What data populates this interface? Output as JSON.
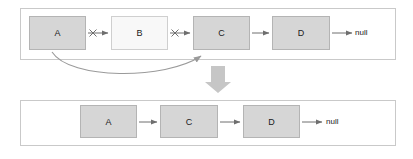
{
  "diagram": {
    "colors": {
      "node_fill": "#d6d6d6",
      "node_removed_fill": "#f8f8f8",
      "node_border": "#b4b4b4",
      "panel_border": "#c9c9c9",
      "arrow": "#6e6e6e",
      "curve_arrow": "#9a9a9a",
      "transition_arrow": "#bfbfbf",
      "background": "#ffffff",
      "text": "#1a1a1a"
    },
    "before": {
      "nodes": [
        {
          "label": "A",
          "state": "kept"
        },
        {
          "label": "B",
          "state": "removed"
        },
        {
          "label": "C",
          "state": "kept"
        },
        {
          "label": "D",
          "state": "kept"
        }
      ],
      "links": [
        {
          "from": "A",
          "to": "B",
          "icon": "crossed-arrow-icon",
          "state": "broken"
        },
        {
          "from": "B",
          "to": "C",
          "icon": "crossed-arrow-icon",
          "state": "broken"
        },
        {
          "from": "C",
          "to": "D",
          "icon": "arrow-icon",
          "state": "intact"
        },
        {
          "from": "D",
          "to": "null",
          "icon": "arrow-icon",
          "state": "intact"
        }
      ],
      "bypass_link": {
        "from": "A",
        "to": "C",
        "icon": "curved-arrow-icon"
      },
      "null_label": "null"
    },
    "transition": {
      "icon": "down-arrow-icon"
    },
    "after": {
      "nodes": [
        {
          "label": "A",
          "state": "kept"
        },
        {
          "label": "C",
          "state": "kept"
        },
        {
          "label": "D",
          "state": "kept"
        }
      ],
      "links": [
        {
          "from": "A",
          "to": "C",
          "icon": "arrow-icon",
          "state": "intact"
        },
        {
          "from": "C",
          "to": "D",
          "icon": "arrow-icon",
          "state": "intact"
        },
        {
          "from": "D",
          "to": "null",
          "icon": "arrow-icon",
          "state": "intact"
        }
      ],
      "null_label": "null"
    }
  }
}
